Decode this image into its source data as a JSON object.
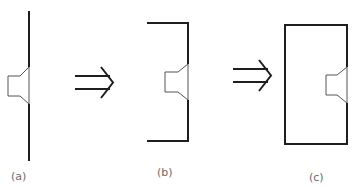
{
  "diagram": {
    "panels": [
      {
        "id": "a",
        "label": "(a)",
        "description": "speaker on flat baffle"
      },
      {
        "id": "b",
        "label": "(b)",
        "description": "speaker on folded baffle"
      },
      {
        "id": "c",
        "label": "(c)",
        "description": "speaker in closed box enclosure"
      }
    ],
    "arrows": [
      {
        "from": "a",
        "to": "b",
        "glyph": "⇒"
      },
      {
        "from": "b",
        "to": "c",
        "glyph": "⇒"
      }
    ],
    "colors": {
      "stroke": "#1e1e1e",
      "speaker_stroke": "#555555",
      "label": "#6a6a6a",
      "background": "#ffffff"
    }
  }
}
